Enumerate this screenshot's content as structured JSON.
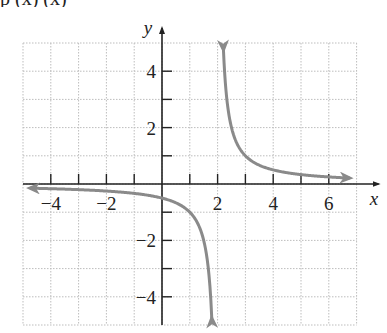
{
  "header": {
    "clipped_text": "p        (x)          (x)"
  },
  "chart_data": {
    "type": "line",
    "title": "",
    "function": "f(x) = 1/(x - 2)",
    "xlabel": "x",
    "ylabel": "y",
    "xlim": [
      -5,
      7
    ],
    "ylim": [
      -5,
      5
    ],
    "grid": true,
    "x_tick_labels": [
      "-4",
      "-2",
      "2",
      "4",
      "6"
    ],
    "y_tick_labels": [
      "4",
      "2",
      "-2",
      "-4"
    ],
    "asymptotes": {
      "vertical": 2,
      "horizontal": 0
    },
    "series": [
      {
        "name": "left branch",
        "x": [
          -4.7,
          -4,
          -3,
          -2,
          -1,
          0,
          1,
          1.5,
          1.75
        ],
        "y": [
          -0.149,
          -0.167,
          -0.2,
          -0.25,
          -0.333,
          -0.5,
          -1,
          -2,
          -4
        ]
      },
      {
        "name": "right branch",
        "x": [
          2.2,
          2.5,
          3,
          4,
          5,
          6,
          6.7
        ],
        "y": [
          5,
          2,
          1,
          0.5,
          0.333,
          0.25,
          0.213
        ]
      }
    ],
    "curve_color": "#8a8a8a",
    "axis_color": "#222222"
  }
}
